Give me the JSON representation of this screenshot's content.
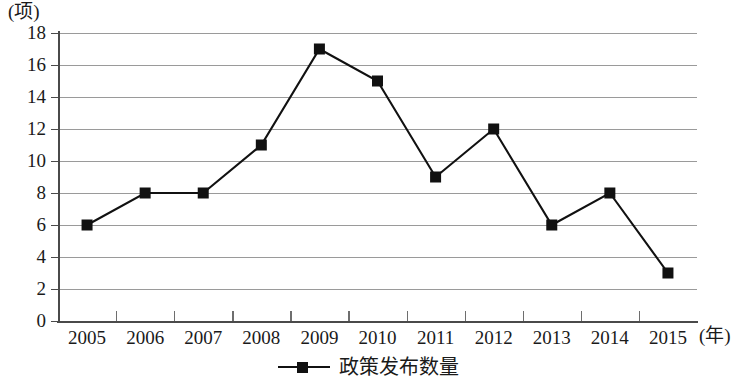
{
  "chart_data": {
    "type": "line",
    "title": "",
    "subtitle": "",
    "xlabel": "(年)",
    "ylabel": "(项)",
    "categories": [
      "2005",
      "2006",
      "2007",
      "2008",
      "2009",
      "2010",
      "2011",
      "2012",
      "2013",
      "2014",
      "2015"
    ],
    "series": [
      {
        "name": "政策发布数量",
        "values": [
          6,
          8,
          8,
          11,
          17,
          15,
          9,
          12,
          6,
          8,
          3
        ],
        "marker": "filled-square",
        "color": "#111111"
      }
    ],
    "ylim": [
      0,
      18
    ],
    "ytick_interval": 2,
    "yticks": [
      0,
      2,
      4,
      6,
      8,
      10,
      12,
      14,
      16,
      18
    ],
    "ytick_labels": [
      "0",
      "2",
      "4",
      "6",
      "8",
      "10",
      "12",
      "14",
      "16",
      "18"
    ],
    "grid": "horizontal",
    "grid_color": "#9a9a9a",
    "legend_position": "bottom-center",
    "legend_entries": [
      "政策发布数量"
    ],
    "axis_color": "#4a4a4a",
    "background": "#ffffff"
  },
  "legend": {
    "label": "政策发布数量"
  },
  "axes": {
    "y_unit": "(项)",
    "x_unit": "(年)"
  }
}
